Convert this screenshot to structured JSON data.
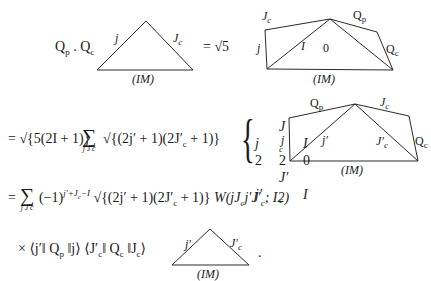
{
  "equation": {
    "line1": {
      "lhs_q1": "Q",
      "lhs_q1_sub": "p",
      "lhs_dot": " . ",
      "lhs_q2": "Q",
      "lhs_q2_sub": "c",
      "equals_sqrt5": "= √5"
    },
    "line2": {
      "prefix": "= √{5(2I + 1)}",
      "sum_symbol": "∑",
      "sum_index": "j′J′c",
      "sqrt_term": "√{(2j′ + 1)(2J′",
      "sqrt_term_sub": "c",
      "sqrt_term_end": " + 1)}",
      "ninej": {
        "row1": [
          "j",
          "J",
          "I"
        ],
        "row1_subs": [
          "",
          "c",
          ""
        ],
        "row2": [
          "2",
          "2",
          "0"
        ],
        "row3": [
          "j′",
          "J′",
          "I"
        ],
        "row3_subs": [
          "",
          "c",
          ""
        ]
      }
    },
    "line3": {
      "prefix": "=",
      "sum_symbol": "∑",
      "sum_index": "j′J′c",
      "phase": "(−1)",
      "phase_exp": "j′+J",
      "phase_exp_sub": "c",
      "phase_exp_end": "−I",
      "sqrt_term": "√{(2j′ + 1)(2J′",
      "sqrt_term_sub": "c",
      "sqrt_term_end": " + 1)}",
      "racah_w": "W(jJ",
      "racah_w_sub1": "c",
      "racah_w_mid": "j′J′",
      "racah_w_sub2": "c",
      "racah_w_end": "; I2)"
    },
    "line4": {
      "times": "×",
      "me1_open": "⟨j′‖ Q",
      "me1_sub": "p",
      "me1_close": " ‖j⟩",
      "me2_open": "⟨J′",
      "me2_sub1": "c",
      "me2_mid": "‖ Q",
      "me2_sub2": "c",
      "me2_close": " ‖J",
      "me2_sub3": "c",
      "me2_end": "⟩",
      "period": "."
    }
  },
  "diagrams": {
    "triangle1": {
      "left_edge": "j",
      "right_edge": "J",
      "right_edge_sub": "c",
      "base": "(IM)"
    },
    "quad1": {
      "top_left_edge": "J",
      "top_left_edge_sub": "c",
      "top_right_edge": "Q",
      "top_right_edge_sub": "p",
      "left_edge": "j",
      "inner_left": "I",
      "inner_right": "0",
      "right_edge": "Q",
      "right_edge_sub": "c",
      "base": "(IM)"
    },
    "quad2": {
      "top_left_edge": "Q",
      "top_left_edge_sub": "p",
      "top_right_edge": "J",
      "top_right_edge_sub": "c",
      "left_edge": "j",
      "inner_left": "j′",
      "inner_right": "J′",
      "inner_right_sub": "c",
      "right_edge": "Q",
      "right_edge_sub": "c",
      "base": "(IM)"
    },
    "triangle3": {
      "left_edge": "j′",
      "right_edge": "J′",
      "right_edge_sub": "c",
      "base": "(IM)"
    }
  }
}
